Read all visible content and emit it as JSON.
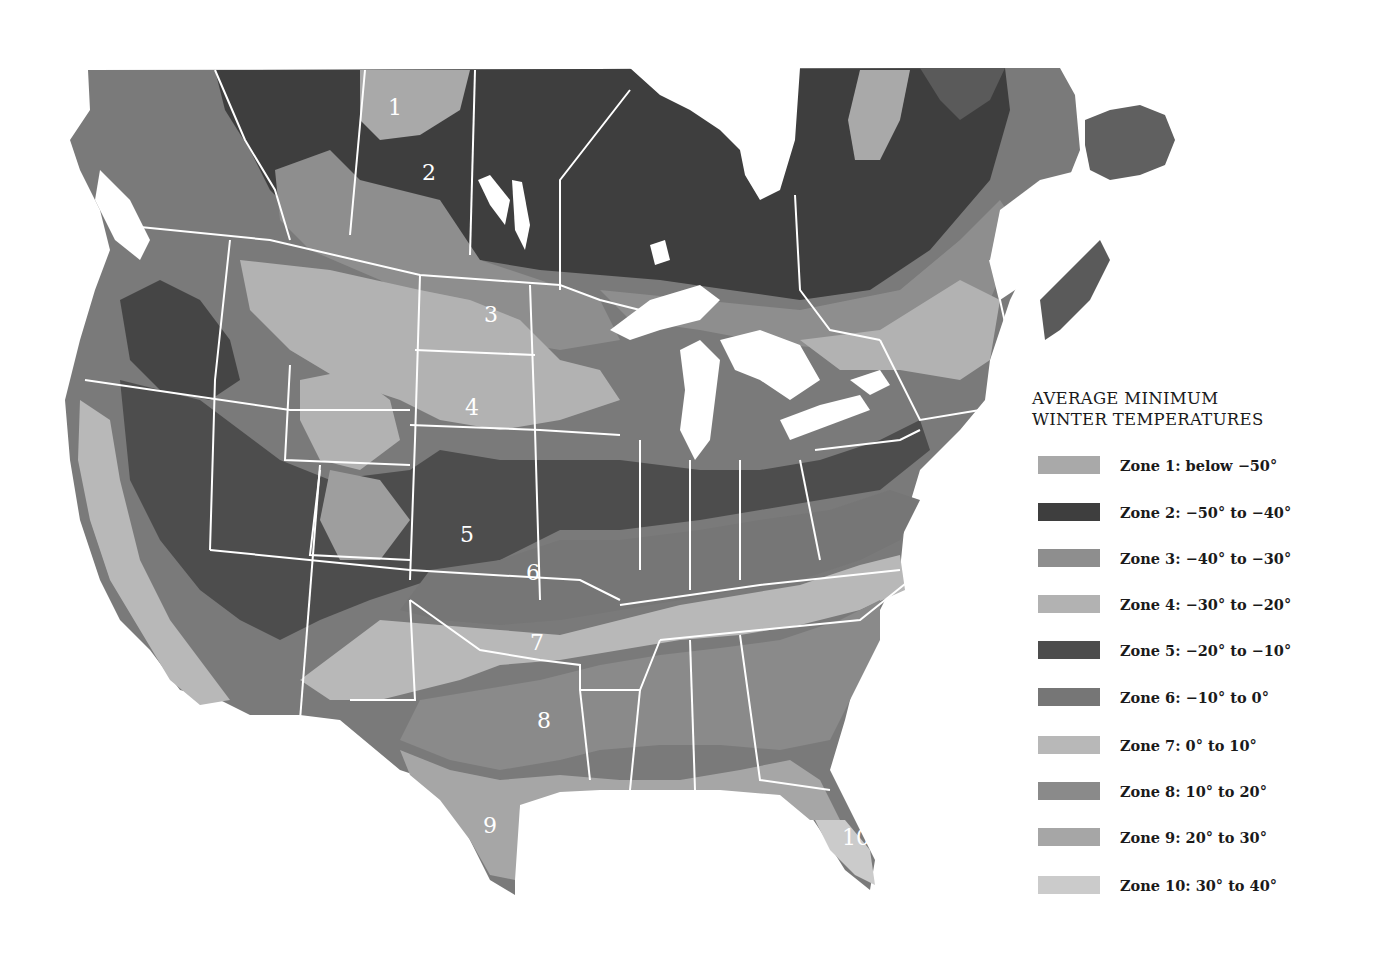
{
  "legend": {
    "title_line1": "AVERAGE MINIMUM",
    "title_line2": "WINTER TEMPERATURES",
    "items": [
      {
        "zone": 1,
        "label": "Zone 1: below −50°",
        "color": "#a9a9a9"
      },
      {
        "zone": 2,
        "label": "Zone 2: −50° to −40°",
        "color": "#3e3e3e"
      },
      {
        "zone": 3,
        "label": "Zone 3: −40° to −30°",
        "color": "#8e8e8e"
      },
      {
        "zone": 4,
        "label": "Zone 4: −30° to −20°",
        "color": "#b2b2b2"
      },
      {
        "zone": 5,
        "label": "Zone 5: −20° to −10°",
        "color": "#4d4d4d"
      },
      {
        "zone": 6,
        "label": "Zone 6: −10° to 0°",
        "color": "#767676"
      },
      {
        "zone": 7,
        "label": "Zone 7: 0° to 10°",
        "color": "#b8b8b8"
      },
      {
        "zone": 8,
        "label": "Zone 8:  10° to 20°",
        "color": "#8a8a8a"
      },
      {
        "zone": 9,
        "label": "Zone 9: 20° to 30°",
        "color": "#a6a6a6"
      },
      {
        "zone": 10,
        "label": "Zone 10: 30° to 40°",
        "color": "#cbcbcb"
      }
    ]
  },
  "map": {
    "zone_labels": [
      {
        "text": "1",
        "x": 396,
        "y": 115
      },
      {
        "text": "2",
        "x": 430,
        "y": 180
      },
      {
        "text": "3",
        "x": 492,
        "y": 322
      },
      {
        "text": "4",
        "x": 473,
        "y": 415
      },
      {
        "text": "5",
        "x": 468,
        "y": 542
      },
      {
        "text": "6",
        "x": 534,
        "y": 580
      },
      {
        "text": "7",
        "x": 538,
        "y": 650
      },
      {
        "text": "8",
        "x": 545,
        "y": 728
      },
      {
        "text": "9",
        "x": 491,
        "y": 833
      },
      {
        "text": "10",
        "x": 856,
        "y": 845
      }
    ]
  }
}
